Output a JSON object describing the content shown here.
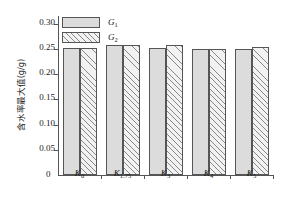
{
  "chart_data": {
    "type": "bar",
    "title": "",
    "xlabel": "",
    "ylabel": "含水率最大值(g/g)",
    "categories": [
      "K0",
      "K1.75",
      "K3",
      "K4",
      "K5"
    ],
    "category_labels": [
      {
        "base": "K",
        "sub": "0"
      },
      {
        "base": "K",
        "sub": "1.75"
      },
      {
        "base": "K",
        "sub": "3"
      },
      {
        "base": "K",
        "sub": "4"
      },
      {
        "base": "K",
        "sub": "5"
      }
    ],
    "series": [
      {
        "name": "G1",
        "name_base": "G",
        "name_sub": "1",
        "values": [
          0.252,
          0.258,
          0.251,
          0.25,
          0.25
        ],
        "fill": "solid-gray",
        "color": "#dcdcdc"
      },
      {
        "name": "G2",
        "name_base": "G",
        "name_sub": "2",
        "values": [
          0.252,
          0.258,
          0.257,
          0.25,
          0.254
        ],
        "fill": "diagonal-hatch",
        "color": "#f2f2f2"
      }
    ],
    "ylim": [
      0,
      0.315
    ],
    "yticks": [
      0,
      0.05,
      0.1,
      0.15,
      0.2,
      0.25,
      0.3
    ],
    "ytick_labels": [
      "0",
      "0.05",
      "0.10",
      "0.15",
      "0.20",
      "0.25",
      "0.30"
    ],
    "grid": false,
    "legend_position": "top-left",
    "axis_color": "#555555",
    "text_color": "#1a1a1a"
  }
}
